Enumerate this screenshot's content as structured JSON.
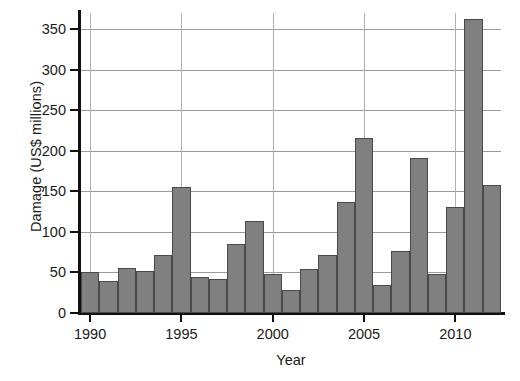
{
  "chart_data": {
    "type": "bar",
    "title": "",
    "xlabel": "Year",
    "ylabel": "Damage (US$ millions)",
    "categories": [
      1990,
      1991,
      1992,
      1993,
      1994,
      1995,
      1996,
      1997,
      1998,
      1999,
      2000,
      2001,
      2002,
      2003,
      2004,
      2005,
      2006,
      2007,
      2008,
      2009,
      2010,
      2011,
      2012
    ],
    "values": [
      50,
      39,
      56,
      52,
      72,
      156,
      45,
      42,
      85,
      113,
      48,
      29,
      54,
      71,
      137,
      216,
      34,
      76,
      191,
      48,
      131,
      363,
      158
    ],
    "xlim": [
      1989.5,
      2012.5
    ],
    "ylim": [
      0,
      370
    ],
    "yticks": [
      0,
      50,
      100,
      150,
      200,
      250,
      300,
      350
    ],
    "ytick_labels": [
      "0",
      "50",
      "100",
      "150",
      "200",
      "250",
      "300",
      "350"
    ],
    "xticks": [
      1990,
      1995,
      2000,
      2005,
      2010
    ],
    "xtick_labels": [
      "1990",
      "1995",
      "2000",
      "2005",
      "2010"
    ],
    "grid": "horizontal-and-vertical",
    "legend": "none",
    "bar_color": "#808080",
    "bar_edge_color": "#4a4a4a",
    "grid_color": "#9a9a9a",
    "axis_color": "#111111"
  }
}
